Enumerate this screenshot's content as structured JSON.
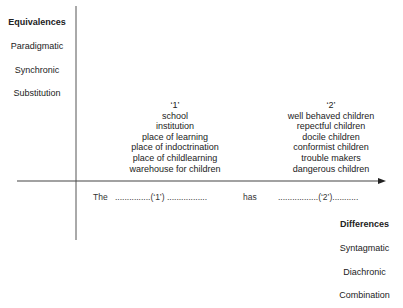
{
  "left_axis": {
    "title": "Equivalences",
    "items": [
      "Paradigmatic",
      "Synchronic",
      "Substitution"
    ]
  },
  "right_axis": {
    "title": "Differences",
    "items": [
      "Syntagmatic",
      "Diachronic",
      "Combination"
    ]
  },
  "column_1": {
    "header": "‘1’",
    "items": [
      "school",
      "institution",
      "place of learning",
      "place of indoctrination",
      "place of childlearning",
      "warehouse for children"
    ]
  },
  "column_2": {
    "header": "‘2’",
    "items": [
      "well behaved children",
      "repectful children",
      "docile children",
      "conformist children",
      "trouble makers",
      "dangerous children"
    ]
  },
  "sentence": {
    "the": "The",
    "slot_1": "...............(‘1’) .................",
    "has": "has",
    "slot_2": ".................(‘2’)..........."
  },
  "colors": {
    "line": "#555555",
    "text": "#222222"
  }
}
